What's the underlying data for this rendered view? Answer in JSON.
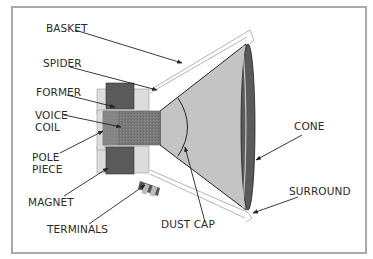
{
  "diagram": {
    "labels": {
      "basket": "BASKET",
      "spider": "SPIDER",
      "former": "FORMER",
      "voice_coil_1": "VOICE",
      "voice_coil_2": "COIL",
      "pole_piece_1": "POLE",
      "pole_piece_2": "PIECE",
      "magnet": "MAGNET",
      "terminals": "TERMINALS",
      "dust_cap": "DUST CAP",
      "cone": "CONE",
      "surround": "SURROUND"
    },
    "colors": {
      "frame_border": "#a9a9a9",
      "cone_fill": "#c4c4c4",
      "surround_dark": "#555555",
      "magnet_dark": "#5a5a5a",
      "plate_light": "#dcdcdc",
      "coil_gray": "#7d7d7d",
      "line": "#222222"
    }
  }
}
